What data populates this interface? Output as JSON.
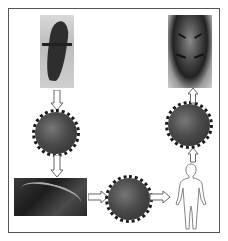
{
  "diagram": {
    "type": "transmission-flow",
    "nodes": [
      {
        "id": "bat",
        "kind": "photo",
        "subject": "bat"
      },
      {
        "id": "virus-1",
        "kind": "icon",
        "subject": "coronavirus"
      },
      {
        "id": "pangolin",
        "kind": "photo",
        "subject": "pangolin"
      },
      {
        "id": "virus-3",
        "kind": "icon",
        "subject": "coronavirus"
      },
      {
        "id": "human",
        "kind": "outline",
        "subject": "human"
      },
      {
        "id": "virus-2",
        "kind": "icon",
        "subject": "coronavirus"
      },
      {
        "id": "tiger",
        "kind": "photo",
        "subject": "tiger"
      }
    ],
    "edges": [
      {
        "from": "bat",
        "to": "virus-1",
        "direction": "down"
      },
      {
        "from": "virus-1",
        "to": "pangolin",
        "direction": "down"
      },
      {
        "from": "pangolin",
        "to": "virus-3",
        "direction": "right"
      },
      {
        "from": "virus-3",
        "to": "human",
        "direction": "right"
      },
      {
        "from": "human",
        "to": "virus-2",
        "direction": "up"
      },
      {
        "from": "virus-2",
        "to": "tiger",
        "direction": "up"
      }
    ],
    "colors": {
      "frame": "#555555",
      "arrow_stroke": "#666666",
      "arrow_fill": "#ffffff",
      "virus": "#3a3a3a"
    }
  }
}
